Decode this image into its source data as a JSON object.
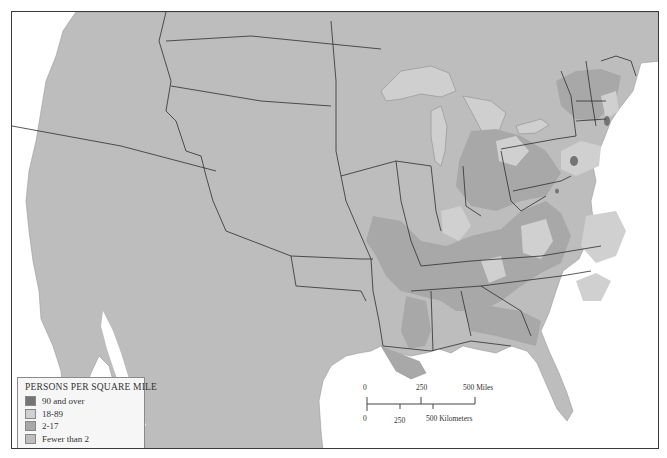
{
  "map": {
    "type": "choropleth",
    "subject": "Population density, eastern and central United States",
    "colors": {
      "water": "#ffffff",
      "land_base": "#bdbdbd",
      "state_border": "#2f2f2f",
      "lakes": "#cfcfcf"
    }
  },
  "legend": {
    "title": "PERSONS PER SQUARE MILE",
    "items": [
      {
        "label": "90 and over",
        "color": "#747474"
      },
      {
        "label": "18-89",
        "color": "#d0d0d0"
      },
      {
        "label": "2-17",
        "color": "#a8a8a8"
      },
      {
        "label": "Fewer than 2",
        "color": "#bdbdbd"
      }
    ]
  },
  "scale_bar": {
    "miles": {
      "ticks": [
        "0",
        "250",
        "500 Miles"
      ]
    },
    "kilometers": {
      "ticks": [
        "0",
        "250",
        "500 Kilometers"
      ]
    }
  }
}
